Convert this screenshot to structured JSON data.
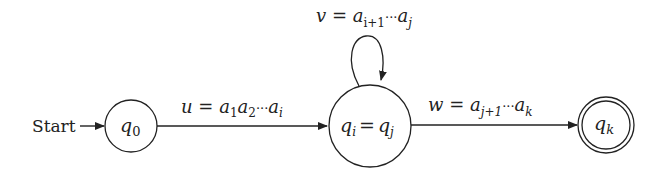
{
  "diagram": {
    "type": "finite-automaton",
    "start_label": "Start",
    "states": [
      {
        "id": "q0",
        "base": "q",
        "sub": "0",
        "accepting": false
      },
      {
        "id": "qi_qj",
        "left": {
          "base": "q",
          "sub": "i"
        },
        "eq": "=",
        "right": {
          "base": "q",
          "sub": "j"
        },
        "accepting": false
      },
      {
        "id": "qk",
        "base": "q",
        "sub": "k",
        "accepting": true
      }
    ],
    "transitions": [
      {
        "from": "q0",
        "to": "qi_qj",
        "var": "u",
        "eq": "=",
        "a1": "a",
        "s1": "1",
        "a2": "a",
        "s2": "2",
        "dots": "···",
        "a3": "a",
        "s3": "i"
      },
      {
        "from": "qi_qj",
        "to": "qi_qj",
        "var": "v",
        "eq": "=",
        "a1": "a",
        "s1": "i+1",
        "dots": "···",
        "a2": "a",
        "s2": "j"
      },
      {
        "from": "qi_qj",
        "to": "qk",
        "var": "w",
        "eq": "=",
        "a1": "a",
        "s1": "j+1",
        "dots": "···",
        "a2": "a",
        "s2": "k"
      }
    ]
  }
}
